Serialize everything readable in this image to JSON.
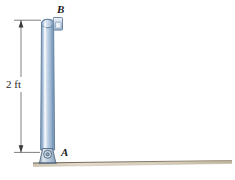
{
  "figure": {
    "labels": {
      "top_point": "B",
      "bottom_point": "A",
      "dimension": "2 ft"
    },
    "icons": {
      "rod": "cylindrical-rod",
      "collar": "collar-block",
      "pin": "pin-support",
      "ground": "ground-surface",
      "dimension_line": "dimension-line-vertical",
      "arrow_top": "arrowhead-up",
      "arrow_bottom": "arrowhead-down"
    },
    "colors": {
      "rod_light": "#e8eef6",
      "rod_mid": "#a9c2dd",
      "rod_dark": "#6b8cb0",
      "rod_outline": "#5a7694",
      "support_fill": "#b9cadd",
      "support_outline": "#51667e",
      "ground_light": "#ded6c6",
      "ground_dark": "#b8ab96",
      "ground_line": "#6f6758",
      "dim_line": "#4a4a4a",
      "text": "#1a1a1a",
      "background": "#ffffff"
    },
    "geometry": {
      "rod_height_ft": 2,
      "rod_top_y": 20,
      "rod_bottom_y": 152,
      "dimension_x": 21
    }
  }
}
